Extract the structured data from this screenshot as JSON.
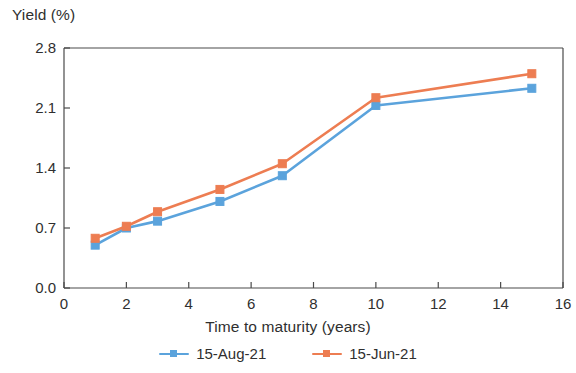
{
  "chart_data": {
    "type": "line",
    "title": "",
    "xlabel": "Time to maturity (years)",
    "ylabel": "Yield (%)",
    "x": [
      1,
      2,
      3,
      5,
      7,
      10,
      15
    ],
    "xlim": [
      0,
      16
    ],
    "ylim": [
      0.0,
      2.8
    ],
    "xticks": [
      "0",
      "2",
      "4",
      "6",
      "8",
      "10",
      "12",
      "14",
      "16"
    ],
    "yticks": [
      "0.0",
      "0.7",
      "1.4",
      "2.1",
      "2.8"
    ],
    "xtick_values": [
      0,
      2,
      4,
      6,
      8,
      10,
      12,
      14,
      16
    ],
    "ytick_values": [
      0.0,
      0.7,
      1.4,
      2.1,
      2.8
    ],
    "grid": false,
    "legend_position": "bottom-center",
    "series": [
      {
        "name": "15-Aug-21",
        "color": "#5BA3DC",
        "marker": "square",
        "values": [
          0.5,
          0.7,
          0.78,
          1.01,
          1.31,
          2.13,
          2.33
        ]
      },
      {
        "name": "15-Jun-21",
        "color": "#ED7D52",
        "marker": "square",
        "values": [
          0.58,
          0.72,
          0.89,
          1.15,
          1.45,
          2.22,
          2.5
        ]
      }
    ]
  },
  "axes": {
    "y_title": "Yield (%)",
    "x_title": "Time to maturity (years)"
  },
  "legend": {
    "items": [
      {
        "label": "15-Aug-21",
        "color": "#5BA3DC"
      },
      {
        "label": "15-Jun-21",
        "color": "#ED7D52"
      }
    ]
  },
  "style": {
    "axis_color": "#4a4a4a",
    "text_color": "#2f2f2f",
    "background": "#ffffff"
  }
}
